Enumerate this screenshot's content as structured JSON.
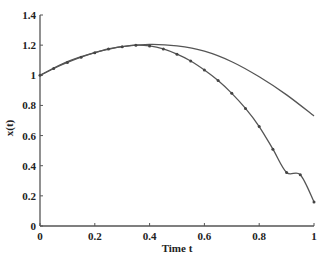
{
  "chart_data": {
    "type": "line",
    "title": "",
    "xlabel": "Time t",
    "ylabel": "x(t)",
    "xlim": [
      0,
      1
    ],
    "ylim": [
      0,
      1.4
    ],
    "grid": false,
    "legend": null,
    "xticks": [
      "0",
      "0.2",
      "0.4",
      "0.6",
      "0.8",
      "1"
    ],
    "yticks": [
      "0",
      "0.2",
      "0.4",
      "0.6",
      "0.8",
      "1",
      "1.2",
      "1.4"
    ],
    "series": [
      {
        "name": "solid curve",
        "style": "line",
        "color": "#555555",
        "x": [
          0,
          0.1,
          0.2,
          0.3,
          0.4,
          0.5,
          0.6,
          0.7,
          0.8,
          0.9,
          1.0
        ],
        "values": [
          1.0,
          1.09,
          1.15,
          1.19,
          1.205,
          1.195,
          1.16,
          1.09,
          0.99,
          0.87,
          0.73
        ]
      },
      {
        "name": "marked curve",
        "style": "line+dots",
        "color": "#555555",
        "x": [
          0,
          0.05,
          0.1,
          0.15,
          0.2,
          0.25,
          0.3,
          0.35,
          0.4,
          0.45,
          0.5,
          0.55,
          0.6,
          0.65,
          0.7,
          0.75,
          0.8,
          0.85,
          0.9,
          0.95,
          1.0
        ],
        "values": [
          1.0,
          1.045,
          1.085,
          1.12,
          1.15,
          1.175,
          1.19,
          1.2,
          1.195,
          1.175,
          1.14,
          1.095,
          1.035,
          0.965,
          0.88,
          0.78,
          0.66,
          0.51,
          0.355,
          0.34,
          0.16
        ]
      }
    ]
  }
}
